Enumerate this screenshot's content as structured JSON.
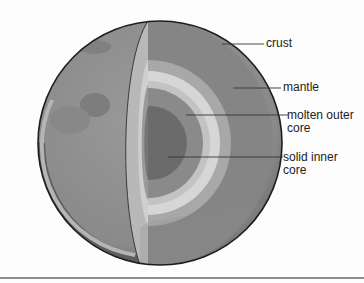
{
  "figure": {
    "labels": {
      "crust": "crust",
      "mantle": "mantle",
      "outer_core_line1": "molten outer",
      "outer_core_line2": "core",
      "inner_core_line1": "solid inner",
      "inner_core_line2": "core"
    },
    "colors": {
      "background": "#fdfdfd",
      "surface": "#8f8f8f",
      "surface_dark": "#6a6a6a",
      "crust_edge": "#b9b9b9",
      "mantle": "#858585",
      "transition_band_1": "#a8a8a8",
      "transition_band_2": "#c9c9c9",
      "light_band": "#dcdcdc",
      "outer_core": "#8a8a8a",
      "inner_core": "#6b6b6b",
      "leader_line": "#333333",
      "rule": "#8c8c8c"
    }
  }
}
